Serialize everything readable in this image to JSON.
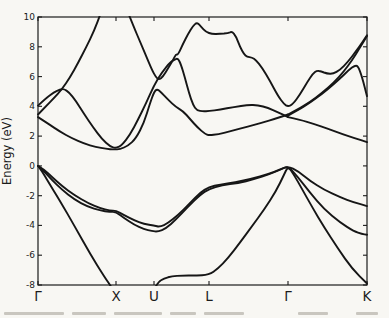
{
  "figure": {
    "ylabel": "Energy (eV)",
    "y_tick_labels": [
      "10",
      "8",
      "6",
      "4",
      "2",
      "0",
      "-2",
      "-4",
      "-6",
      "-8"
    ],
    "x_tick_labels": [
      "Γ",
      "X",
      "U",
      "L",
      "Γ",
      "K"
    ]
  },
  "chart_data": {
    "type": "line",
    "title": "",
    "xlabel": "",
    "ylabel": "Energy (eV)",
    "ylim": [
      -8,
      10
    ],
    "grid": false,
    "legend": "none",
    "ink_color": "#161616",
    "categories": [
      "Γ",
      "X",
      "U",
      "L",
      "Γ",
      "K"
    ],
    "x_positions_px": [
      38,
      116,
      154,
      209,
      288,
      367
    ],
    "y_ticks": [
      10,
      8,
      6,
      4,
      2,
      0,
      -2,
      -4,
      -6,
      -8
    ],
    "series": [
      {
        "name": "valence-band-1-gamma-to-X",
        "points": [
          [
            38,
            0
          ],
          [
            42,
            -0.35
          ],
          [
            48,
            -1.05
          ],
          [
            60,
            -2.35
          ],
          [
            75,
            -4.1
          ],
          [
            90,
            -5.9
          ],
          [
            104,
            -7.4
          ],
          [
            113,
            -8.3
          ]
        ]
      },
      {
        "name": "valence-band-1-U-to-K",
        "points": [
          [
            154,
            -8.3
          ],
          [
            158,
            -7.8
          ],
          [
            164,
            -7.55
          ],
          [
            172,
            -7.42
          ],
          [
            182,
            -7.36
          ],
          [
            195,
            -7.37
          ],
          [
            209,
            -7.33
          ],
          [
            218,
            -6.9
          ],
          [
            228,
            -6.2
          ],
          [
            240,
            -5.15
          ],
          [
            252,
            -4.05
          ],
          [
            264,
            -2.95
          ],
          [
            276,
            -1.7
          ],
          [
            284,
            -0.6
          ],
          [
            288,
            -0.02
          ],
          [
            294,
            -0.6
          ],
          [
            302,
            -1.55
          ],
          [
            312,
            -2.75
          ],
          [
            324,
            -4.1
          ],
          [
            338,
            -5.55
          ],
          [
            352,
            -6.9
          ],
          [
            367,
            -7.9
          ]
        ]
      },
      {
        "name": "valence-band-2",
        "points": [
          [
            38,
            0
          ],
          [
            44,
            -0.25
          ],
          [
            52,
            -0.75
          ],
          [
            62,
            -1.35
          ],
          [
            74,
            -1.95
          ],
          [
            88,
            -2.5
          ],
          [
            100,
            -2.85
          ],
          [
            110,
            -3.0
          ],
          [
            116,
            -3.0
          ],
          [
            124,
            -3.3
          ],
          [
            134,
            -3.65
          ],
          [
            144,
            -3.9
          ],
          [
            154,
            -4.02
          ],
          [
            160,
            -4.1
          ],
          [
            168,
            -3.85
          ],
          [
            178,
            -3.3
          ],
          [
            190,
            -2.5
          ],
          [
            200,
            -1.8
          ],
          [
            209,
            -1.42
          ],
          [
            220,
            -1.25
          ],
          [
            235,
            -1.1
          ],
          [
            252,
            -0.85
          ],
          [
            268,
            -0.55
          ],
          [
            280,
            -0.25
          ],
          [
            288,
            -0.02
          ],
          [
            298,
            -0.35
          ],
          [
            310,
            -1.0
          ],
          [
            324,
            -1.6
          ],
          [
            340,
            -2.1
          ],
          [
            354,
            -2.45
          ],
          [
            367,
            -2.7
          ]
        ]
      },
      {
        "name": "valence-band-3",
        "points": [
          [
            38,
            0
          ],
          [
            44,
            -0.35
          ],
          [
            52,
            -0.95
          ],
          [
            62,
            -1.6
          ],
          [
            74,
            -2.25
          ],
          [
            88,
            -2.75
          ],
          [
            100,
            -3.0
          ],
          [
            110,
            -3.08
          ],
          [
            116,
            -3.1
          ],
          [
            124,
            -3.5
          ],
          [
            134,
            -3.95
          ],
          [
            144,
            -4.25
          ],
          [
            152,
            -4.38
          ],
          [
            158,
            -4.42
          ],
          [
            166,
            -4.2
          ],
          [
            176,
            -3.6
          ],
          [
            188,
            -2.75
          ],
          [
            200,
            -1.95
          ],
          [
            209,
            -1.55
          ],
          [
            222,
            -1.3
          ],
          [
            238,
            -1.15
          ],
          [
            254,
            -0.9
          ],
          [
            270,
            -0.55
          ],
          [
            282,
            -0.2
          ],
          [
            288,
            -0.02
          ],
          [
            298,
            -0.75
          ],
          [
            310,
            -1.8
          ],
          [
            324,
            -2.9
          ],
          [
            340,
            -3.8
          ],
          [
            354,
            -4.4
          ],
          [
            362,
            -4.58
          ],
          [
            367,
            -4.62
          ]
        ]
      },
      {
        "name": "conduction-band-1",
        "points": [
          [
            38,
            3.28
          ],
          [
            48,
            2.85
          ],
          [
            60,
            2.3
          ],
          [
            72,
            1.85
          ],
          [
            84,
            1.5
          ],
          [
            96,
            1.27
          ],
          [
            106,
            1.14
          ],
          [
            114,
            1.1
          ],
          [
            120,
            1.12
          ],
          [
            128,
            1.35
          ],
          [
            136,
            1.85
          ],
          [
            144,
            2.9
          ],
          [
            150,
            4.2
          ],
          [
            154,
            4.95
          ],
          [
            157,
            5.18
          ],
          [
            161,
            4.95
          ],
          [
            168,
            4.45
          ],
          [
            176,
            3.95
          ],
          [
            183,
            3.68
          ],
          [
            190,
            3.15
          ],
          [
            198,
            2.55
          ],
          [
            205,
            2.15
          ],
          [
            209,
            2.05
          ],
          [
            218,
            2.12
          ],
          [
            232,
            2.35
          ],
          [
            248,
            2.65
          ],
          [
            262,
            2.9
          ],
          [
            276,
            3.18
          ],
          [
            288,
            3.45
          ]
        ]
      },
      {
        "name": "conduction-band-2",
        "points": [
          [
            38,
            4.05
          ],
          [
            46,
            4.55
          ],
          [
            54,
            4.95
          ],
          [
            60,
            5.13
          ],
          [
            64,
            5.17
          ],
          [
            69,
            4.95
          ],
          [
            76,
            4.35
          ],
          [
            84,
            3.5
          ],
          [
            93,
            2.6
          ],
          [
            102,
            1.8
          ],
          [
            110,
            1.3
          ],
          [
            116,
            1.18
          ],
          [
            122,
            1.4
          ],
          [
            130,
            2.1
          ],
          [
            138,
            3.1
          ],
          [
            146,
            4.2
          ],
          [
            154,
            5.4
          ],
          [
            162,
            6.3
          ],
          [
            170,
            6.95
          ],
          [
            175,
            7.15
          ],
          [
            178,
            7.22
          ],
          [
            181,
            6.8
          ],
          [
            185,
            5.9
          ],
          [
            189,
            4.9
          ],
          [
            193,
            4.1
          ],
          [
            197,
            3.72
          ],
          [
            203,
            3.66
          ],
          [
            209,
            3.68
          ],
          [
            220,
            3.78
          ],
          [
            234,
            3.95
          ],
          [
            248,
            4.1
          ],
          [
            258,
            4.08
          ],
          [
            268,
            3.9
          ],
          [
            278,
            3.6
          ],
          [
            288,
            3.28
          ]
        ]
      },
      {
        "name": "conduction-band-upper",
        "points": [
          [
            128,
            10.3
          ],
          [
            134,
            9.3
          ],
          [
            140,
            8.35
          ],
          [
            146,
            7.4
          ],
          [
            152,
            6.45
          ],
          [
            156,
            5.95
          ],
          [
            159,
            5.78
          ],
          [
            163,
            6.0
          ],
          [
            168,
            6.55
          ],
          [
            173,
            7.1
          ],
          [
            176,
            7.5
          ],
          [
            178,
            7.45
          ],
          [
            183,
            8.2
          ],
          [
            188,
            8.85
          ],
          [
            193,
            9.4
          ],
          [
            197,
            9.65
          ],
          [
            201,
            9.35
          ],
          [
            206,
            9.0
          ],
          [
            212,
            8.85
          ],
          [
            220,
            8.87
          ],
          [
            228,
            8.92
          ],
          [
            232,
            9.03
          ],
          [
            236,
            8.7
          ],
          [
            240,
            8.0
          ],
          [
            244,
            7.5
          ],
          [
            247,
            7.33
          ],
          [
            252,
            7.28
          ],
          [
            256,
            7.1
          ],
          [
            262,
            6.6
          ],
          [
            270,
            5.7
          ],
          [
            278,
            4.7
          ],
          [
            284,
            4.15
          ],
          [
            288,
            3.98
          ],
          [
            293,
            4.15
          ],
          [
            300,
            4.8
          ],
          [
            307,
            5.6
          ],
          [
            313,
            6.2
          ],
          [
            317,
            6.4
          ],
          [
            321,
            6.35
          ],
          [
            327,
            6.2
          ],
          [
            333,
            6.17
          ],
          [
            340,
            6.45
          ],
          [
            348,
            7.0
          ],
          [
            356,
            7.7
          ],
          [
            362,
            8.25
          ],
          [
            367,
            8.78
          ]
        ]
      },
      {
        "name": "conduction-band-steep-gamma-X",
        "points": [
          [
            38,
            3.45
          ],
          [
            46,
            4.0
          ],
          [
            54,
            4.55
          ],
          [
            62,
            5.15
          ],
          [
            70,
            5.95
          ],
          [
            78,
            6.9
          ],
          [
            86,
            7.95
          ],
          [
            94,
            9.05
          ],
          [
            101,
            10.3
          ]
        ]
      },
      {
        "name": "conduction-band-gamma-K-rising",
        "points": [
          [
            288,
            3.45
          ],
          [
            298,
            3.8
          ],
          [
            310,
            4.3
          ],
          [
            322,
            4.9
          ],
          [
            334,
            5.6
          ],
          [
            344,
            6.35
          ],
          [
            352,
            7.1
          ],
          [
            360,
            7.95
          ],
          [
            367,
            8.72
          ]
        ]
      },
      {
        "name": "conduction-band-gamma-K-middle",
        "points": [
          [
            288,
            3.38
          ],
          [
            298,
            3.74
          ],
          [
            310,
            4.24
          ],
          [
            322,
            4.84
          ],
          [
            334,
            5.5
          ],
          [
            342,
            6.0
          ],
          [
            349,
            6.45
          ],
          [
            355,
            6.75
          ],
          [
            358,
            6.7
          ],
          [
            362,
            6.0
          ],
          [
            367,
            4.68
          ]
        ]
      },
      {
        "name": "conduction-band-gamma-K-lower",
        "points": [
          [
            288,
            3.28
          ],
          [
            300,
            3.1
          ],
          [
            314,
            2.82
          ],
          [
            328,
            2.5
          ],
          [
            342,
            2.15
          ],
          [
            355,
            1.85
          ],
          [
            367,
            1.6
          ]
        ]
      }
    ]
  }
}
